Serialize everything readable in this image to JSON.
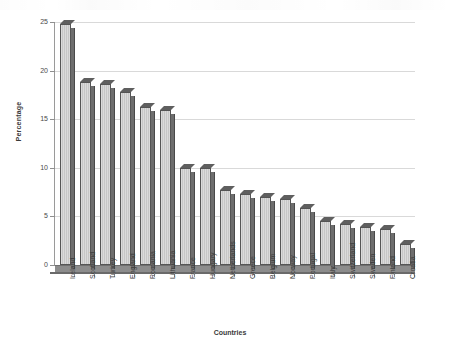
{
  "chart_data": {
    "type": "bar",
    "title": "",
    "xlabel": "Countries",
    "ylabel": "Percentage",
    "ylim": [
      0,
      25
    ],
    "yticks": [
      0,
      5,
      10,
      15,
      20,
      25
    ],
    "ytick_labels": [
      "0",
      "5",
      "10",
      "15",
      "20",
      "25"
    ],
    "grid": true,
    "legend": "none",
    "categories": [
      "Ireland",
      "Scotland",
      "Turkey",
      "England",
      "Romania",
      "Lithuania",
      "France",
      "Hungary",
      "Netherlands",
      "Greece",
      "Belgium",
      "Norway",
      "Portugal",
      "Italy",
      "Switzerland",
      "Sweden",
      "Finland",
      "Croatia"
    ],
    "values": [
      24.8,
      18.8,
      18.6,
      17.8,
      16.3,
      15.9,
      10.0,
      10.0,
      7.7,
      7.3,
      7.0,
      6.8,
      5.9,
      4.5,
      4.2,
      3.9,
      3.7,
      2.2
    ],
    "bar_color": "#c6c6c6",
    "bar_edge_color": "#555555",
    "bar_shadow_color": "#6e6e6e",
    "gridline_color": "#d9d9d9",
    "axis_color": "#9a9a9a"
  }
}
